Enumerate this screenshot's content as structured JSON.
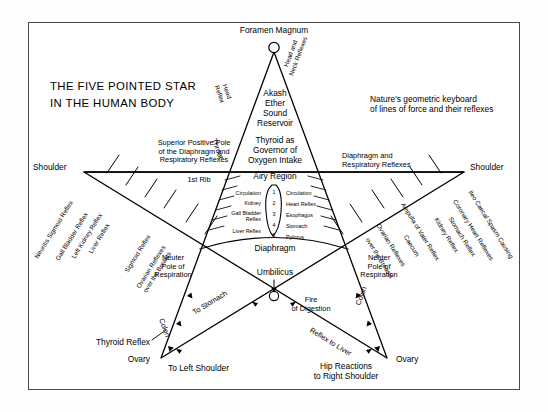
{
  "meta": {
    "title_line1": "THE FIVE POINTED STAR",
    "title_line2": "IN THE HUMAN BODY",
    "subtitle_line1": "Nature's geometric keyboard",
    "subtitle_line2": "of lines of force and their reflexes",
    "ink": "#000000",
    "frame": "#4a4a4a",
    "background": "#ffffff"
  },
  "apex": {
    "label": "Foramen Magnum",
    "left_leg": "Head\nReflex",
    "right_leg": "Head and\nNeck Reflexes",
    "throat": "Throat"
  },
  "head_block": {
    "akash": "Akash\nEther\nSound\nReservoir",
    "thyroid": "Thyroid as\nGovernor of\nOxygen Intake"
  },
  "shoulder_line": {
    "left_label": "Shoulder",
    "right_label": "Shoulder",
    "superior_pole": "Superior Positive Pole\nof the Diaphragm and\nRespiratory Reflexes",
    "diaphragm_right": "Diaphragm and\nRespiratory Reflexes",
    "first_rib": "1st Rib"
  },
  "airy_region": {
    "title": "Airy Region",
    "left_items": [
      "Circulation",
      "Kidney",
      "Gall Bladder\nReflex",
      "Liver Reflex"
    ],
    "right_items": [
      "Circulation",
      "Heart Reflex",
      "Esophagus",
      "Stomach",
      "Pylorus"
    ],
    "numbers": [
      "1",
      "2",
      "3",
      "4",
      "5"
    ]
  },
  "left_arm_reflexes": [
    "Neuritis Sigmoid Reflex",
    "Gall Bladder Reflex",
    "Left Kidney Reflex",
    "Liver Reflex",
    "Sigmoid Reflex",
    "Ovarian Reflexes\nover the Breasts"
  ],
  "right_arm_reflexes": [
    "Ileo Caecal Spasm Causing",
    "Coronary Heart Reflexes",
    "Stomach Reflex",
    "Kidney Reflex",
    "Ampulla of Vater Reflex",
    "Caecum",
    "Ovarian Reflexes",
    "over the Breasts"
  ],
  "core": {
    "diaphragm": "Diaphragm",
    "umbilicus": "Umbilicus",
    "fire_of_digestion": "Fire\nof Digestion",
    "neuter_left": "Neuter\nPole of\nRespiration",
    "neuter_right": "Neuter\nPole of\nRespiration"
  },
  "legs": {
    "colon_left": "Colon",
    "colon_right": "Colon",
    "to_stomach": "To Stomach",
    "reflex_to_liver": "Reflex to Liver",
    "thyroid_reflex": "Thyroid Reflex",
    "ovary_left": "Ovary",
    "ovary_right": "Ovary",
    "to_left_shoulder": "To Left Shoulder",
    "hip_reactions": "Hip Reactions\nto Right Shoulder"
  }
}
